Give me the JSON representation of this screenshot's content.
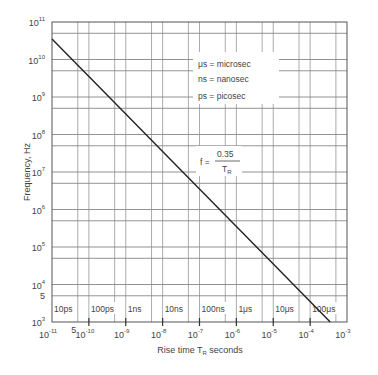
{
  "chart_data": {
    "type": "line",
    "title": "",
    "xlabel": "Rise time T_R seconds",
    "ylabel": "Frequency, Hz",
    "xscale": "log",
    "yscale": "log",
    "xlim": [
      1e-11,
      0.001
    ],
    "ylim": [
      1000.0,
      100000000000.0
    ],
    "grid": true,
    "x_tick_labels": [
      "10^-11",
      "10^-10",
      "10^-9",
      "10^-8",
      "10^-7",
      "10^-6",
      "10^-5",
      "10^-4",
      "10^-3"
    ],
    "y_tick_labels": [
      "10^3",
      "10^4",
      "10^5",
      "10^6",
      "10^7",
      "10^8",
      "10^9",
      "10^10",
      "10^11"
    ],
    "extra_tick_labels": {
      "x_5": "5",
      "y_5": "5"
    },
    "series": [
      {
        "name": "f = 0.35 / T_R",
        "x": [
          1e-11,
          1e-10,
          1e-09,
          1e-08,
          1e-07,
          1e-06,
          1e-05,
          0.0001,
          0.00035
        ],
        "y": [
          35000000000.0,
          3500000000.0,
          350000000.0,
          35000000.0,
          3500000.0,
          350000.0,
          35000.0,
          3500.0,
          1000.0
        ]
      }
    ],
    "annotations": {
      "formula": {
        "lhs": "f =",
        "numerator": "0.35",
        "denominator": "T_R"
      },
      "legend_lines": [
        "μs = microsec",
        "ns = nanosec",
        "ps = picosec"
      ],
      "rise_time_labels": [
        "10ps",
        "100ps",
        "1ns",
        "10ns",
        "100ns",
        "1μs",
        "10μs",
        "100μs"
      ]
    }
  },
  "labels": {
    "ylabel_text": "Frequency,  Hz",
    "xlabel_prefix": "Rise  time  T",
    "xlabel_sub": "R",
    "xlabel_suffix": " seconds",
    "legend_1": "μs = microsec",
    "legend_2": "ns = nanosec",
    "legend_3": "ps = picosec",
    "formula_lhs": "f =",
    "formula_num": "0.35",
    "formula_den_main": "T",
    "formula_den_sub": "R",
    "five": "5"
  }
}
